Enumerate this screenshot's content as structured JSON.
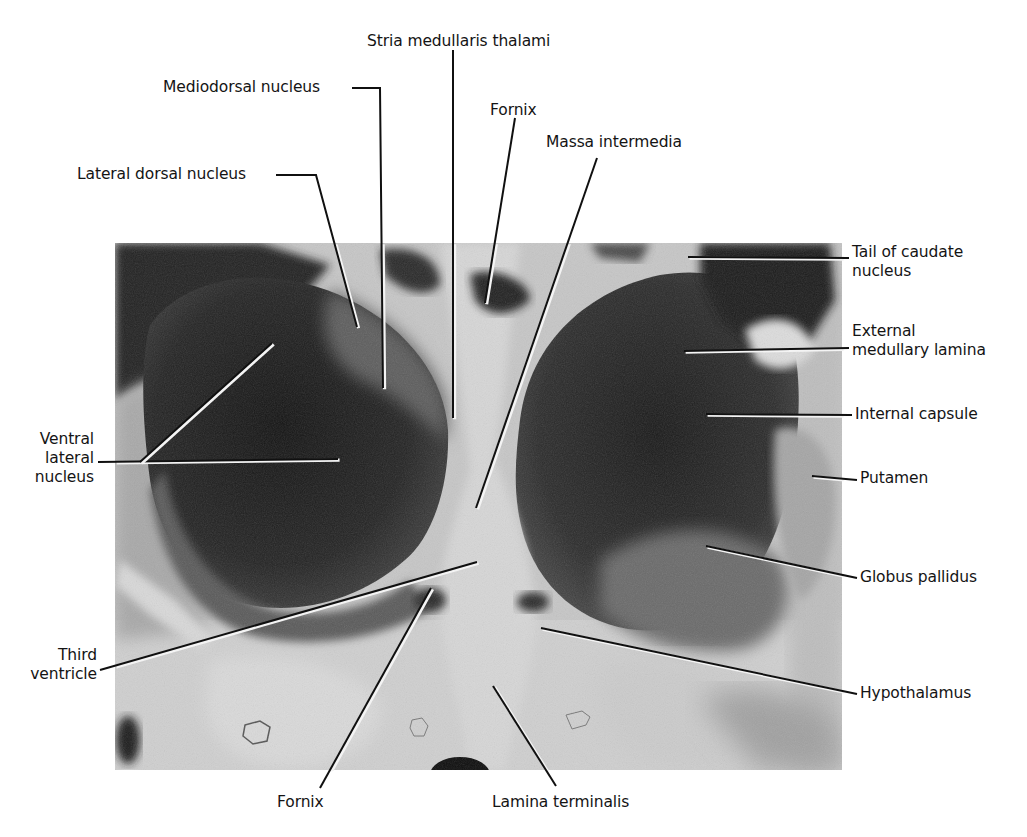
{
  "figure": {
    "type": "labeled anatomical photograph",
    "photo": {
      "x": 115,
      "y": 243,
      "width": 727,
      "height": 527
    },
    "colors": {
      "background": "#ffffff",
      "photo_light": "#c9c9c9",
      "photo_mid": "#8a8a8a",
      "photo_dark": "#1e1e1e",
      "leader_dark": "#101010",
      "leader_light": "#f4f4f4",
      "text": "#141414"
    }
  },
  "labels": [
    {
      "id": "stria-medullaris-thalami",
      "lines": [
        "Stria medullaris thalami"
      ],
      "x": 367,
      "y": 32,
      "align": "left"
    },
    {
      "id": "mediodorsal-nucleus",
      "lines": [
        "Mediodorsal nucleus"
      ],
      "x": 163,
      "y": 78,
      "align": "left"
    },
    {
      "id": "fornix-top",
      "lines": [
        "Fornix"
      ],
      "x": 490,
      "y": 101,
      "align": "left"
    },
    {
      "id": "massa-intermedia",
      "lines": [
        "Massa intermedia"
      ],
      "x": 546,
      "y": 133,
      "align": "left"
    },
    {
      "id": "lateral-dorsal-nucleus",
      "lines": [
        "Lateral dorsal nucleus"
      ],
      "x": 77,
      "y": 165,
      "align": "left"
    },
    {
      "id": "tail-of-caudate-nucleus",
      "lines": [
        "Tail of caudate",
        "nucleus"
      ],
      "x": 852,
      "y": 243,
      "align": "left"
    },
    {
      "id": "external-medullary-lamina",
      "lines": [
        "External",
        "medullary lamina"
      ],
      "x": 852,
      "y": 322,
      "align": "left"
    },
    {
      "id": "internal-capsule",
      "lines": [
        "Internal capsule"
      ],
      "x": 855,
      "y": 405,
      "align": "left"
    },
    {
      "id": "ventral-lateral-nucleus",
      "lines": [
        "Ventral",
        "lateral",
        "nucleus"
      ],
      "x": 20,
      "y": 430,
      "align": "right",
      "width": 74
    },
    {
      "id": "putamen",
      "lines": [
        "Putamen"
      ],
      "x": 860,
      "y": 469,
      "align": "left"
    },
    {
      "id": "globus-pallidus",
      "lines": [
        "Globus pallidus"
      ],
      "x": 860,
      "y": 568,
      "align": "left"
    },
    {
      "id": "third-ventricle",
      "lines": [
        "Third",
        "ventricle"
      ],
      "x": 20,
      "y": 646,
      "align": "right",
      "width": 77
    },
    {
      "id": "hypothalamus",
      "lines": [
        "Hypothalamus"
      ],
      "x": 860,
      "y": 684,
      "align": "left"
    },
    {
      "id": "fornix-bottom",
      "lines": [
        "Fornix"
      ],
      "x": 277,
      "y": 793,
      "align": "left"
    },
    {
      "id": "lamina-terminalis",
      "lines": [
        "Lamina terminalis"
      ],
      "x": 492,
      "y": 793,
      "align": "left"
    }
  ],
  "leaders": [
    {
      "label": "stria-medullaris-thalami",
      "points": [
        [
          453,
          50
        ],
        [
          453,
          418
        ]
      ]
    },
    {
      "label": "mediodorsal-nucleus",
      "points": [
        [
          352,
          88
        ],
        [
          380,
          88
        ],
        [
          383,
          388
        ]
      ]
    },
    {
      "label": "fornix-top",
      "points": [
        [
          515,
          118
        ],
        [
          485,
          303
        ]
      ]
    },
    {
      "label": "massa-intermedia",
      "points": [
        [
          597,
          158
        ],
        [
          476,
          508
        ]
      ]
    },
    {
      "label": "lateral-dorsal-nucleus",
      "points": [
        [
          276,
          175
        ],
        [
          316,
          175
        ],
        [
          357,
          327
        ]
      ]
    },
    {
      "label": "tail-of-caudate-nucleus",
      "points": [
        [
          849,
          258
        ],
        [
          688,
          257
        ]
      ]
    },
    {
      "label": "external-medullary-lamina",
      "points": [
        [
          849,
          348
        ],
        [
          684,
          351
        ]
      ]
    },
    {
      "label": "internal-capsule",
      "points": [
        [
          852,
          415
        ],
        [
          706,
          414
        ]
      ]
    },
    {
      "label": "ventral-lateral-nucleus-a",
      "points": [
        [
          98,
          462
        ],
        [
          338,
          459
        ]
      ]
    },
    {
      "label": "ventral-lateral-nucleus-b",
      "points": [
        [
          140,
          462
        ],
        [
          272,
          343
        ]
      ]
    },
    {
      "label": "putamen",
      "points": [
        [
          857,
          480
        ],
        [
          812,
          476
        ]
      ]
    },
    {
      "label": "globus-pallidus",
      "points": [
        [
          857,
          578
        ],
        [
          706,
          546
        ]
      ]
    },
    {
      "label": "third-ventricle",
      "points": [
        [
          100,
          670
        ],
        [
          477,
          562
        ]
      ]
    },
    {
      "label": "hypothalamus",
      "points": [
        [
          857,
          694
        ],
        [
          541,
          628
        ]
      ]
    },
    {
      "label": "fornix-bottom",
      "points": [
        [
          320,
          788
        ],
        [
          431,
          588
        ]
      ]
    },
    {
      "label": "lamina-terminalis",
      "points": [
        [
          556,
          786
        ],
        [
          493,
          686
        ]
      ]
    }
  ]
}
